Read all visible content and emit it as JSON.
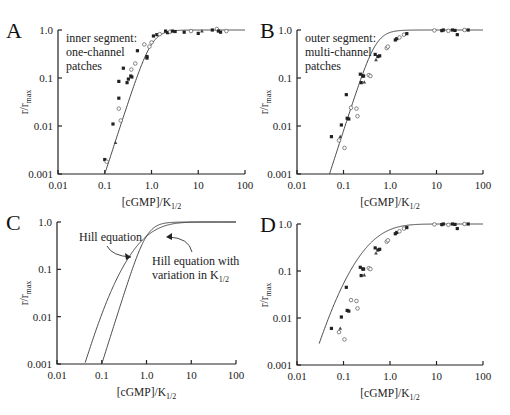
{
  "chart_data": [
    {
      "id": "A",
      "type": "scatter",
      "panel_letter": "A",
      "title": "",
      "annotation": [
        "inner segment:",
        "one-channel",
        "patches"
      ],
      "xlabel_main": "[cGMP]/K",
      "xlabel_sub": "1/2",
      "ylabel_main": "r/r",
      "ylabel_sub": "max",
      "xscale": "log",
      "yscale": "log",
      "xlim": [
        0.01,
        100
      ],
      "ylim": [
        0.001,
        1.0
      ],
      "xticks": [
        "0.01",
        "0.1",
        "1.0",
        "10",
        "100"
      ],
      "yticks": [
        "0.001",
        "0.01",
        "0.1",
        "1.0"
      ],
      "curves": [
        {
          "name": "Hill equation",
          "model": "hill",
          "n": 3,
          "k": 1.0
        }
      ],
      "points": [
        {
          "x": 0.1,
          "y": 0.002,
          "m": "f"
        },
        {
          "x": 0.11,
          "y": 0.0018,
          "m": "o"
        },
        {
          "x": 0.15,
          "y": 0.011,
          "m": "f"
        },
        {
          "x": 0.17,
          "y": 0.0045,
          "m": "t"
        },
        {
          "x": 0.2,
          "y": 0.038,
          "m": "f"
        },
        {
          "x": 0.2,
          "y": 0.023,
          "m": "o"
        },
        {
          "x": 0.2,
          "y": 0.085,
          "m": "f"
        },
        {
          "x": 0.22,
          "y": 0.013,
          "m": "o"
        },
        {
          "x": 0.25,
          "y": 0.16,
          "m": "f"
        },
        {
          "x": 0.3,
          "y": 0.08,
          "m": "f"
        },
        {
          "x": 0.32,
          "y": 0.095,
          "m": "f"
        },
        {
          "x": 0.36,
          "y": 0.11,
          "m": "f"
        },
        {
          "x": 0.37,
          "y": 0.15,
          "m": "o"
        },
        {
          "x": 0.38,
          "y": 0.105,
          "m": "f"
        },
        {
          "x": 0.5,
          "y": 0.37,
          "m": "f"
        },
        {
          "x": 0.45,
          "y": 0.2,
          "m": "o"
        },
        {
          "x": 0.7,
          "y": 0.5,
          "m": "o"
        },
        {
          "x": 0.8,
          "y": 0.28,
          "m": "f"
        },
        {
          "x": 0.8,
          "y": 0.26,
          "m": "f"
        },
        {
          "x": 0.9,
          "y": 0.45,
          "m": "o"
        },
        {
          "x": 1.0,
          "y": 0.55,
          "m": "o"
        },
        {
          "x": 1.1,
          "y": 0.75,
          "m": "f"
        },
        {
          "x": 1.3,
          "y": 0.8,
          "m": "f"
        },
        {
          "x": 1.5,
          "y": 0.82,
          "m": "o"
        },
        {
          "x": 2.0,
          "y": 0.95,
          "m": "f"
        },
        {
          "x": 2.2,
          "y": 0.88,
          "m": "f"
        },
        {
          "x": 2.5,
          "y": 0.92,
          "m": "o"
        },
        {
          "x": 2.8,
          "y": 0.95,
          "m": "f"
        },
        {
          "x": 3.2,
          "y": 0.93,
          "m": "f"
        },
        {
          "x": 5.0,
          "y": 0.9,
          "m": "f"
        },
        {
          "x": 7.0,
          "y": 0.95,
          "m": "o"
        },
        {
          "x": 10,
          "y": 0.85,
          "m": "f"
        },
        {
          "x": 12,
          "y": 0.95,
          "m": "t"
        },
        {
          "x": 20,
          "y": 1.0,
          "m": "f"
        },
        {
          "x": 25,
          "y": 1.05,
          "m": "o"
        },
        {
          "x": 27,
          "y": 0.95,
          "m": "f"
        },
        {
          "x": 30,
          "y": 0.9,
          "m": "f"
        },
        {
          "x": 40,
          "y": 0.95,
          "m": "o"
        }
      ]
    },
    {
      "id": "B",
      "type": "scatter",
      "panel_letter": "B",
      "annotation": [
        "outer segment:",
        "multi-channel",
        "patches"
      ],
      "xlabel_main": "[cGMP]/K",
      "xlabel_sub": "1/2",
      "ylabel_main": "r/r",
      "ylabel_sub": "max",
      "xscale": "log",
      "yscale": "log",
      "xlim": [
        0.01,
        100
      ],
      "ylim": [
        0.001,
        1.0
      ],
      "xticks": [
        "0.01",
        "0.1",
        "1.0",
        "10",
        "100"
      ],
      "yticks": [
        "0.001",
        "0.01",
        "0.1",
        "1.0"
      ],
      "curves": [
        {
          "name": "Hill equation",
          "model": "hill",
          "n": 3,
          "k": 0.5
        }
      ],
      "points": [
        {
          "x": 0.055,
          "y": 0.006,
          "m": "f"
        },
        {
          "x": 0.08,
          "y": 0.005,
          "m": "o"
        },
        {
          "x": 0.085,
          "y": 0.006,
          "m": "t"
        },
        {
          "x": 0.09,
          "y": 0.0105,
          "m": "f"
        },
        {
          "x": 0.105,
          "y": 0.0035,
          "m": "o"
        },
        {
          "x": 0.115,
          "y": 0.045,
          "m": "f"
        },
        {
          "x": 0.12,
          "y": 0.0145,
          "m": "f"
        },
        {
          "x": 0.13,
          "y": 0.014,
          "m": "f"
        },
        {
          "x": 0.145,
          "y": 0.024,
          "m": "o"
        },
        {
          "x": 0.19,
          "y": 0.023,
          "m": "o"
        },
        {
          "x": 0.2,
          "y": 0.016,
          "m": "o"
        },
        {
          "x": 0.23,
          "y": 0.12,
          "m": "f"
        },
        {
          "x": 0.24,
          "y": 0.08,
          "m": "f"
        },
        {
          "x": 0.26,
          "y": 0.11,
          "m": "f"
        },
        {
          "x": 0.27,
          "y": 0.11,
          "m": "f"
        },
        {
          "x": 0.28,
          "y": 0.082,
          "m": "t"
        },
        {
          "x": 0.35,
          "y": 0.115,
          "m": "o"
        },
        {
          "x": 0.38,
          "y": 0.11,
          "m": "o"
        },
        {
          "x": 0.48,
          "y": 0.31,
          "m": "f"
        },
        {
          "x": 0.5,
          "y": 0.24,
          "m": "t"
        },
        {
          "x": 0.55,
          "y": 0.28,
          "m": "f"
        },
        {
          "x": 0.6,
          "y": 0.29,
          "m": "f"
        },
        {
          "x": 0.85,
          "y": 0.42,
          "m": "o"
        },
        {
          "x": 0.9,
          "y": 0.45,
          "m": "o"
        },
        {
          "x": 1.3,
          "y": 0.62,
          "m": "f"
        },
        {
          "x": 1.4,
          "y": 0.66,
          "m": "f"
        },
        {
          "x": 1.6,
          "y": 0.7,
          "m": "o"
        },
        {
          "x": 2.0,
          "y": 0.8,
          "m": "o"
        },
        {
          "x": 2.3,
          "y": 0.84,
          "m": "f"
        },
        {
          "x": 9.0,
          "y": 0.98,
          "m": "o"
        },
        {
          "x": 13,
          "y": 0.97,
          "m": "f"
        },
        {
          "x": 14,
          "y": 1.0,
          "m": "f"
        },
        {
          "x": 18,
          "y": 0.96,
          "m": "o"
        },
        {
          "x": 22,
          "y": 1.0,
          "m": "f"
        },
        {
          "x": 25,
          "y": 0.98,
          "m": "f"
        },
        {
          "x": 28,
          "y": 0.8,
          "m": "f"
        },
        {
          "x": 40,
          "y": 1.0,
          "m": "o"
        },
        {
          "x": 48,
          "y": 1.0,
          "m": "f"
        }
      ]
    },
    {
      "id": "C",
      "type": "line",
      "panel_letter": "C",
      "xlabel_main": "[cGMP]/K",
      "xlabel_sub": "1/2",
      "ylabel_main": "r/r",
      "ylabel_sub": "max",
      "xscale": "log",
      "yscale": "log",
      "xlim": [
        0.01,
        100
      ],
      "ylim": [
        0.001,
        1.0
      ],
      "xticks": [
        "0.01",
        "0.1",
        "1.0",
        "10",
        "100"
      ],
      "yticks": [
        "0.001",
        "0.01",
        "0.1",
        "1.0"
      ],
      "curves": [
        {
          "name": "Hill equation",
          "model": "hill",
          "n": 3,
          "k": 1.0
        },
        {
          "name": "Hill equation with variation in K1/2",
          "model": "hill_var",
          "n": 3,
          "k": 1.0,
          "spread": 0.35
        }
      ],
      "annotations": [
        {
          "label": "Hill equation",
          "lines": [
            "Hill equation"
          ],
          "points_to": "Hill equation"
        },
        {
          "label": "Hill equation with variation in K1/2",
          "lines": [
            "Hill equation with",
            "variation in K"
          ],
          "sub": "1/2",
          "points_to": "Hill equation with variation in K1/2"
        }
      ]
    },
    {
      "id": "D",
      "type": "scatter",
      "panel_letter": "D",
      "xlabel_main": "[cGMP]/K",
      "xlabel_sub": "1/2",
      "ylabel_main": "r/r",
      "ylabel_sub": "max",
      "xscale": "log",
      "yscale": "log",
      "xlim": [
        0.01,
        100
      ],
      "ylim": [
        0.001,
        1.0
      ],
      "xticks": [
        "0.01",
        "0.1",
        "1.0",
        "10",
        "100"
      ],
      "yticks": [
        "0.001",
        "0.01",
        "0.1",
        "1.0"
      ],
      "curves": [
        {
          "name": "Hill equation with variation in K1/2",
          "model": "hill_var",
          "n": 3,
          "k": 0.5,
          "spread": 0.35
        }
      ],
      "points": [
        {
          "x": 0.055,
          "y": 0.006,
          "m": "f"
        },
        {
          "x": 0.08,
          "y": 0.005,
          "m": "o"
        },
        {
          "x": 0.085,
          "y": 0.006,
          "m": "t"
        },
        {
          "x": 0.09,
          "y": 0.0105,
          "m": "f"
        },
        {
          "x": 0.105,
          "y": 0.0035,
          "m": "o"
        },
        {
          "x": 0.115,
          "y": 0.045,
          "m": "f"
        },
        {
          "x": 0.12,
          "y": 0.0145,
          "m": "f"
        },
        {
          "x": 0.13,
          "y": 0.014,
          "m": "f"
        },
        {
          "x": 0.145,
          "y": 0.024,
          "m": "o"
        },
        {
          "x": 0.19,
          "y": 0.023,
          "m": "o"
        },
        {
          "x": 0.2,
          "y": 0.016,
          "m": "o"
        },
        {
          "x": 0.23,
          "y": 0.12,
          "m": "f"
        },
        {
          "x": 0.24,
          "y": 0.08,
          "m": "f"
        },
        {
          "x": 0.26,
          "y": 0.11,
          "m": "f"
        },
        {
          "x": 0.27,
          "y": 0.11,
          "m": "f"
        },
        {
          "x": 0.28,
          "y": 0.082,
          "m": "t"
        },
        {
          "x": 0.35,
          "y": 0.115,
          "m": "o"
        },
        {
          "x": 0.38,
          "y": 0.11,
          "m": "o"
        },
        {
          "x": 0.48,
          "y": 0.31,
          "m": "f"
        },
        {
          "x": 0.5,
          "y": 0.24,
          "m": "t"
        },
        {
          "x": 0.55,
          "y": 0.28,
          "m": "f"
        },
        {
          "x": 0.6,
          "y": 0.29,
          "m": "f"
        },
        {
          "x": 0.85,
          "y": 0.42,
          "m": "o"
        },
        {
          "x": 0.9,
          "y": 0.45,
          "m": "o"
        },
        {
          "x": 1.3,
          "y": 0.62,
          "m": "f"
        },
        {
          "x": 1.4,
          "y": 0.66,
          "m": "f"
        },
        {
          "x": 1.6,
          "y": 0.7,
          "m": "o"
        },
        {
          "x": 2.0,
          "y": 0.8,
          "m": "o"
        },
        {
          "x": 2.3,
          "y": 0.84,
          "m": "f"
        },
        {
          "x": 9.0,
          "y": 0.98,
          "m": "o"
        },
        {
          "x": 13,
          "y": 0.97,
          "m": "f"
        },
        {
          "x": 14,
          "y": 1.0,
          "m": "f"
        },
        {
          "x": 18,
          "y": 0.96,
          "m": "o"
        },
        {
          "x": 22,
          "y": 1.0,
          "m": "f"
        },
        {
          "x": 25,
          "y": 0.98,
          "m": "f"
        },
        {
          "x": 28,
          "y": 0.8,
          "m": "f"
        },
        {
          "x": 40,
          "y": 1.0,
          "m": "o"
        },
        {
          "x": 48,
          "y": 1.0,
          "m": "f"
        }
      ]
    }
  ]
}
